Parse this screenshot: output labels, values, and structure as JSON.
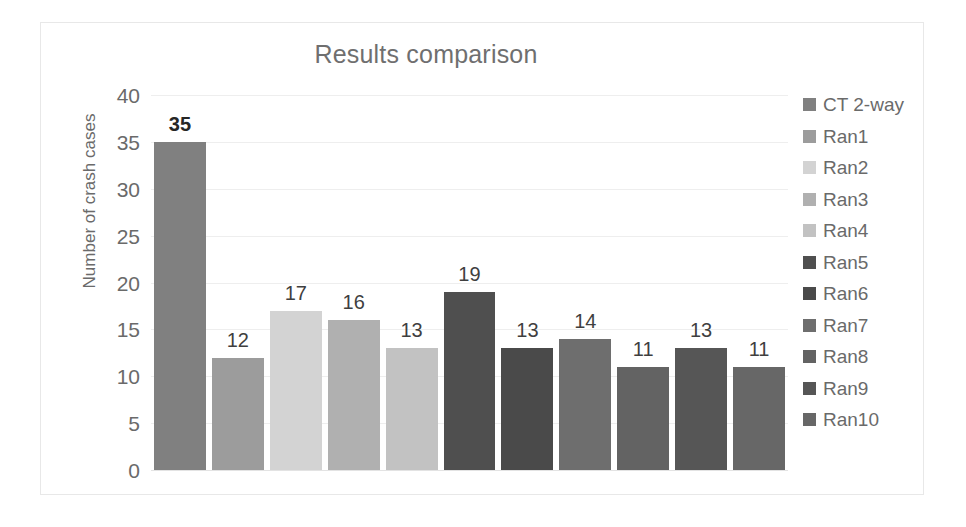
{
  "chart_data": {
    "type": "bar",
    "title": "Results comparison",
    "xlabel": "",
    "ylabel": "Number of crash cases",
    "ylim": [
      0,
      40
    ],
    "ytick_step": 5,
    "yticks": [
      "40",
      "35",
      "30",
      "25",
      "20",
      "15",
      "10",
      "5",
      "0"
    ],
    "grid": true,
    "legend_position": "right",
    "categories": [
      "CT 2-way",
      "Ran1",
      "Ran2",
      "Ran3",
      "Ran4",
      "Ran5",
      "Ran6",
      "Ran7",
      "Ran8",
      "Ran9",
      "Ran10"
    ],
    "values": [
      35,
      12,
      17,
      16,
      13,
      19,
      13,
      14,
      11,
      13,
      11
    ],
    "data_labels": [
      "35",
      "12",
      "17",
      "16",
      "13",
      "19",
      "13",
      "14",
      "11",
      "13",
      "11"
    ],
    "emphasized_label_index": 0,
    "colors": [
      "#808080",
      "#9c9c9c",
      "#d3d3d3",
      "#b0b0b0",
      "#c2c2c2",
      "#4f4f4f",
      "#4a4a4a",
      "#6e6e6e",
      "#636363",
      "#565656",
      "#676767"
    ],
    "series": [
      {
        "name": "Number of crash cases",
        "points": [
          {
            "category": "CT 2-way",
            "value": 35,
            "color": "#808080"
          },
          {
            "category": "Ran1",
            "value": 12,
            "color": "#9c9c9c"
          },
          {
            "category": "Ran2",
            "value": 17,
            "color": "#d3d3d3"
          },
          {
            "category": "Ran3",
            "value": 16,
            "color": "#b0b0b0"
          },
          {
            "category": "Ran4",
            "value": 13,
            "color": "#c2c2c2"
          },
          {
            "category": "Ran5",
            "value": 19,
            "color": "#4f4f4f"
          },
          {
            "category": "Ran6",
            "value": 13,
            "color": "#4a4a4a"
          },
          {
            "category": "Ran7",
            "value": 14,
            "color": "#6e6e6e"
          },
          {
            "category": "Ran8",
            "value": 11,
            "color": "#636363"
          },
          {
            "category": "Ran9",
            "value": 13,
            "color": "#565656"
          },
          {
            "category": "Ran10",
            "value": 11,
            "color": "#676767"
          }
        ]
      }
    ]
  },
  "legend": {
    "items": [
      {
        "label": "CT 2-way",
        "color": "#808080"
      },
      {
        "label": "Ran1",
        "color": "#9c9c9c"
      },
      {
        "label": "Ran2",
        "color": "#d3d3d3"
      },
      {
        "label": "Ran3",
        "color": "#b0b0b0"
      },
      {
        "label": "Ran4",
        "color": "#c2c2c2"
      },
      {
        "label": "Ran5",
        "color": "#4f4f4f"
      },
      {
        "label": "Ran6",
        "color": "#4a4a4a"
      },
      {
        "label": "Ran7",
        "color": "#6e6e6e"
      },
      {
        "label": "Ran8",
        "color": "#636363"
      },
      {
        "label": "Ran9",
        "color": "#565656"
      },
      {
        "label": "Ran10",
        "color": "#676767"
      }
    ]
  },
  "style": {
    "text_color": "#6a6a6a",
    "title_color": "#6f6f6f",
    "label_color": "#3f3f3f",
    "gridline_color": "#eeeeee",
    "frame_color": "#e8e8e8",
    "background": "#ffffff"
  }
}
